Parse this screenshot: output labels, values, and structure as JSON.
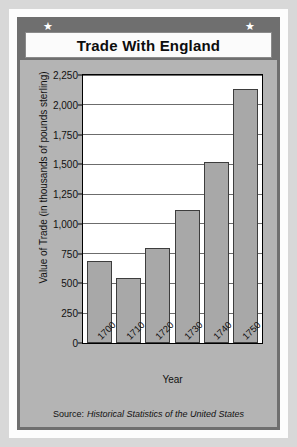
{
  "header": {
    "title": "Trade With England",
    "star_glyph": "★"
  },
  "footer": {
    "source_prefix": "Source:",
    "source_title": "Historical Statistics of the United States"
  },
  "chart_data": {
    "type": "bar",
    "title": "Trade With England",
    "categories": [
      "1700",
      "1710",
      "1720",
      "1730",
      "1740",
      "1750"
    ],
    "values": [
      690,
      550,
      800,
      1120,
      1520,
      2130
    ],
    "xlabel": "Year",
    "ylabel": "Value of Trade  (in thousands of pounds sterling)",
    "ylim": [
      0,
      2250
    ],
    "ytick_step": 250,
    "yticks": [
      "0",
      "250",
      "500",
      "750",
      "1,000",
      "1,250",
      "1,500",
      "1,750",
      "2,000",
      "2,250"
    ],
    "ytick_values": [
      0,
      250,
      500,
      750,
      1000,
      1250,
      1500,
      1750,
      2000,
      2250
    ],
    "grid": true,
    "legend": "none",
    "bar_color": "#a8a8a8",
    "bar_border_color": "#3d3d3d",
    "plot_background": "#ffffff",
    "panel_background": "#b4b4b4",
    "accent_color": "#6f6f6f"
  }
}
